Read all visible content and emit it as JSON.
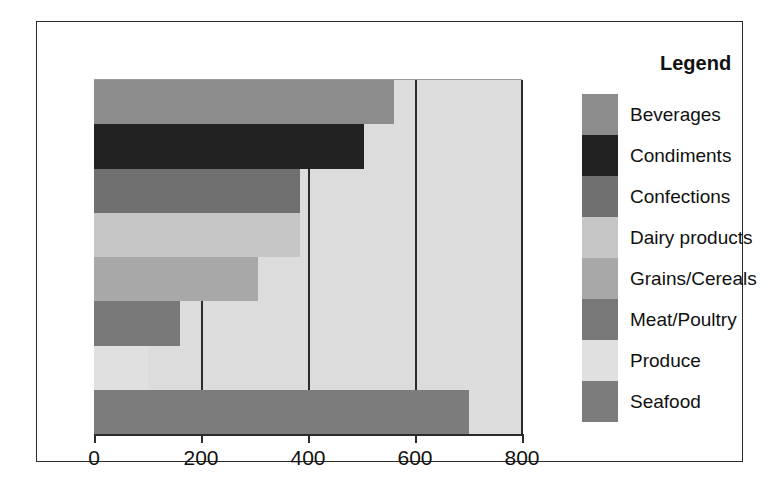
{
  "chart_data": {
    "type": "bar",
    "orientation": "horizontal",
    "title": "",
    "xlabel": "",
    "ylabel": "",
    "xlim": [
      0,
      800
    ],
    "ylim": null,
    "grid": true,
    "legend_position": "right",
    "legend_title": "Legend",
    "categories": [
      "Beverages",
      "Condiments",
      "Confections",
      "Dairy products",
      "Grains/Cereals",
      "Meat/Poultry",
      "Produce",
      "Seafood"
    ],
    "values": [
      560,
      505,
      385,
      385,
      307,
      161,
      100,
      700
    ],
    "colors": [
      "#8c8c8c",
      "#222222",
      "#707070",
      "#c6c6c6",
      "#a8a8a8",
      "#787878",
      "#e0e0e0",
      "#7c7c7c"
    ],
    "tick_labels": [
      "0",
      "200",
      "400",
      "600",
      "800"
    ],
    "tick_values": [
      0,
      200,
      400,
      600,
      800
    ],
    "plot_background": "#dcdcdc",
    "axis_color": "#2b2b2b"
  },
  "legend": {
    "title": "Legend",
    "items": [
      {
        "label": "Beverages",
        "color": "#8c8c8c"
      },
      {
        "label": "Condiments",
        "color": "#222222"
      },
      {
        "label": "Confections",
        "color": "#707070"
      },
      {
        "label": "Dairy products",
        "color": "#c6c6c6"
      },
      {
        "label": "Grains/Cereals",
        "color": "#a8a8a8"
      },
      {
        "label": "Meat/Poultry",
        "color": "#787878"
      },
      {
        "label": "Produce",
        "color": "#e0e0e0"
      },
      {
        "label": "Seafood",
        "color": "#7c7c7c"
      }
    ]
  },
  "axis": {
    "ticks": [
      "0",
      "200",
      "400",
      "600",
      "800"
    ]
  }
}
